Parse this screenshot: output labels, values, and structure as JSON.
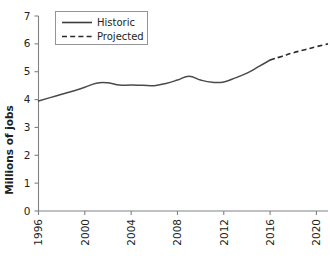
{
  "chart_data": {
    "type": "line",
    "title": "",
    "xlabel": "",
    "ylabel": "Millions of jobs",
    "xlim": [
      1996,
      2021
    ],
    "ylim": [
      0,
      7
    ],
    "grid": false,
    "legend_position": "top-left",
    "x_ticks": [
      "1996",
      "2000",
      "2004",
      "2008",
      "2012",
      "2016",
      "2020"
    ],
    "x_tick_values": [
      1996,
      2000,
      2004,
      2008,
      2012,
      2016,
      2020
    ],
    "y_ticks": [
      "0",
      "1",
      "2",
      "3",
      "4",
      "5",
      "6",
      "7"
    ],
    "y_tick_values": [
      0,
      1,
      2,
      3,
      4,
      5,
      6,
      7
    ],
    "series": [
      {
        "name": "Historic",
        "style": "solid",
        "color": "#4a4a4a",
        "x": [
          1996,
          1997,
          1998,
          1999,
          2000,
          2001,
          2002,
          2003,
          2004,
          2005,
          2006,
          2007,
          2008,
          2009,
          2010,
          2011,
          2012,
          2013,
          2014,
          2015,
          2016
        ],
        "values": [
          3.95,
          4.07,
          4.19,
          4.31,
          4.44,
          4.59,
          4.6,
          4.52,
          4.52,
          4.51,
          4.5,
          4.58,
          4.7,
          4.84,
          4.7,
          4.62,
          4.63,
          4.78,
          4.95,
          5.18,
          5.42
        ]
      },
      {
        "name": "Projected",
        "style": "dashed",
        "color": "#2b2b2b",
        "x": [
          2016,
          2017,
          2018,
          2019,
          2020,
          2021
        ],
        "values": [
          5.42,
          5.55,
          5.68,
          5.79,
          5.9,
          6.0
        ]
      }
    ],
    "legend": [
      {
        "label": "Historic",
        "style": "solid"
      },
      {
        "label": "Projected",
        "style": "dashed"
      }
    ]
  }
}
